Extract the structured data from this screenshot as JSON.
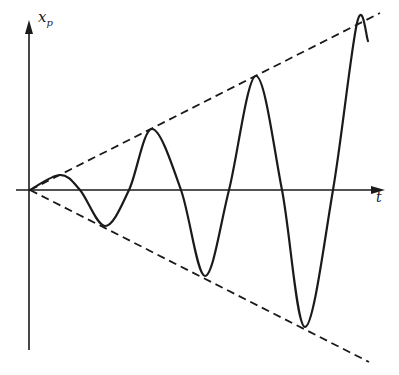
{
  "chart_data": {
    "type": "line",
    "title": "",
    "xlabel": "t",
    "ylabel": "x_p",
    "ylabel_main": "x",
    "ylabel_sub": "p",
    "grid": false,
    "legend": null,
    "axis_ticks": "none",
    "series": [
      {
        "name": "x_p(t)",
        "style": "solid",
        "points_px": [
          [
            30,
            190
          ],
          [
            60,
            175
          ],
          [
            80,
            190
          ],
          [
            105,
            226
          ],
          [
            129,
            190
          ],
          [
            152,
            129
          ],
          [
            181,
            190
          ],
          [
            205,
            276
          ],
          [
            229,
            190
          ],
          [
            256,
            76
          ],
          [
            282,
            190
          ],
          [
            305,
            327
          ],
          [
            333,
            190
          ],
          [
            357,
            23
          ],
          [
            368,
            41
          ]
        ],
        "extrema": [
          {
            "kind": "peak",
            "t_px": 60,
            "amplitude_px": 15
          },
          {
            "kind": "trough",
            "t_px": 105,
            "amplitude_px": -36
          },
          {
            "kind": "peak",
            "t_px": 152,
            "amplitude_px": 61
          },
          {
            "kind": "trough",
            "t_px": 205,
            "amplitude_px": -86
          },
          {
            "kind": "peak",
            "t_px": 256,
            "amplitude_px": 114
          },
          {
            "kind": "trough",
            "t_px": 305,
            "amplitude_px": -137
          },
          {
            "kind": "peak",
            "t_px": 357,
            "amplitude_px": 167
          }
        ]
      },
      {
        "name": "upper envelope",
        "style": "dashed",
        "points_px": [
          [
            30,
            190
          ],
          [
            380,
            13
          ]
        ]
      },
      {
        "name": "lower envelope",
        "style": "dashed",
        "points_px": [
          [
            30,
            190
          ],
          [
            369,
            362
          ]
        ]
      }
    ]
  },
  "axes": {
    "x_label": "t",
    "y_label_main": "x",
    "y_label_sub": "p"
  },
  "colors": {
    "ink": "#1a1a1a",
    "background": "#ffffff"
  }
}
